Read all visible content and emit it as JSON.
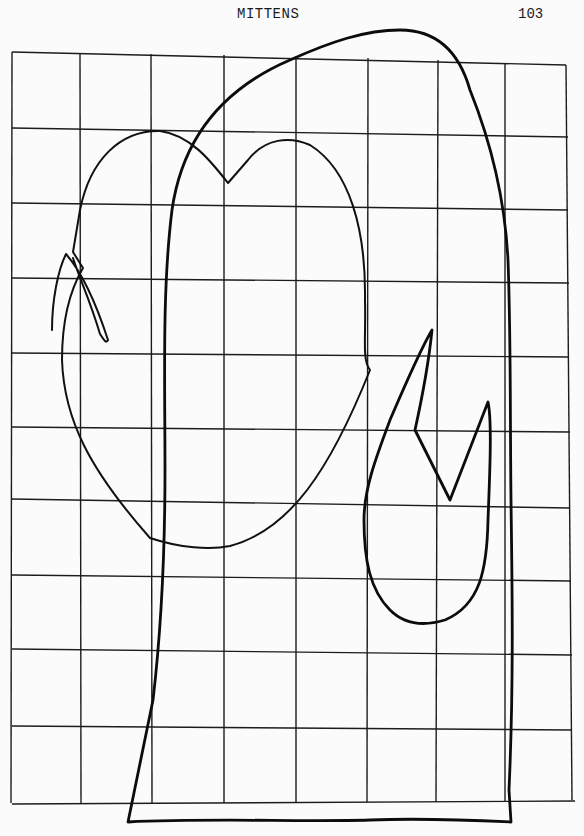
{
  "page": {
    "header_title": "MITTENS",
    "page_number": "103"
  },
  "diagram": {
    "type": "sewing-pattern-grid",
    "grid": {
      "columns": 8,
      "rows": 10,
      "vertical_lines_x": [
        12,
        80,
        152,
        224,
        296,
        368,
        438,
        505,
        566
      ],
      "horizontal_lines_y": [
        52,
        128,
        203,
        278,
        353,
        427,
        500,
        575,
        650,
        727,
        803
      ],
      "line_color": "#1c1c1c"
    },
    "shapes": [
      {
        "name": "large-mitten-outline",
        "stroke": "#0c0c0c",
        "stroke_width": 2.8
      },
      {
        "name": "large-mitten-thumb-slit",
        "stroke": "#0c0c0c",
        "stroke_width": 2.8
      },
      {
        "name": "small-mitten-outline",
        "stroke": "#111111",
        "stroke_width": 2.0
      },
      {
        "name": "small-mitten-thumb-slit",
        "stroke": "#111111",
        "stroke_width": 2.0
      }
    ]
  }
}
